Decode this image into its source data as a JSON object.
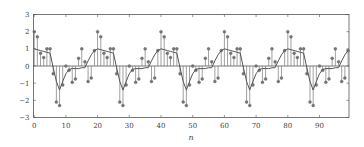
{
  "chart_data": {
    "type": "stem+line",
    "title": "",
    "xlabel": "n",
    "ylabel": "",
    "xlim": [
      0,
      99
    ],
    "ylim": [
      -3,
      3
    ],
    "xticks": [
      0,
      10,
      20,
      30,
      40,
      50,
      60,
      70,
      80,
      90
    ],
    "xtick_labels": [
      "0",
      "10",
      "20",
      "30",
      "40",
      "50",
      "60",
      "70",
      "80",
      "90"
    ],
    "yticks": [
      -3,
      -2,
      -1,
      0,
      1,
      2,
      3
    ],
    "ytick_labels": [
      "−3",
      "−2",
      "−1",
      "0",
      "1",
      "2",
      "3"
    ],
    "grid": false,
    "legend": null,
    "period": 20,
    "n_samples": 100,
    "series": [
      {
        "name": "x[n] (stem)",
        "style": "stem",
        "period_values": [
          2.0,
          1.7,
          0.75,
          0.5,
          1.0,
          1.0,
          -0.45,
          -2.1,
          -2.3,
          -1.1,
          0.0,
          -0.25,
          -0.95,
          -0.75,
          0.45,
          1.0,
          0.25,
          -0.9,
          -0.7,
          0.9
        ]
      },
      {
        "name": "y[n] (line)",
        "style": "line",
        "period_values": [
          1.0,
          0.95,
          0.9,
          0.85,
          0.8,
          0.75,
          -0.1,
          -0.9,
          -1.4,
          -0.9,
          -0.45,
          -0.2,
          -0.15,
          -0.15,
          -0.15,
          -0.1,
          -0.1,
          0.3,
          0.65,
          0.9
        ]
      }
    ],
    "colors": {
      "stem": "#777777",
      "marker": "#777777",
      "line": "#555555",
      "axes": "#555555"
    }
  }
}
